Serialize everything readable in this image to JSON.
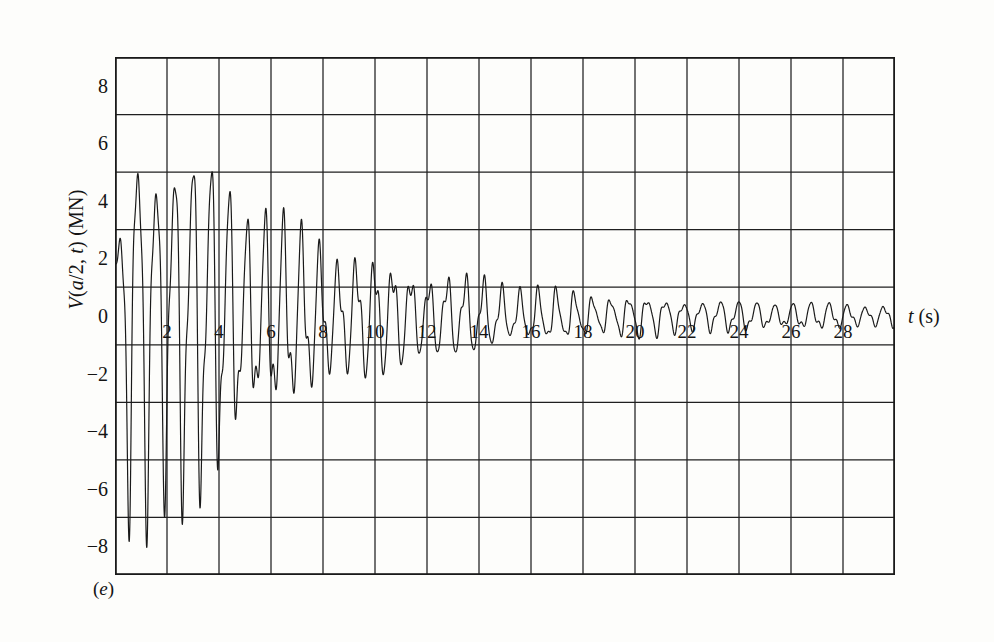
{
  "figure": {
    "caption_label": "(e)",
    "caption_open": "(",
    "caption_letter": "e",
    "caption_close": ")"
  },
  "axes": {
    "y_label_prefix": "V(",
    "y_label_var": "a",
    "y_label_mid": "/2, ",
    "y_label_var2": "t",
    "y_label_suffix": ") (MN)",
    "y_label_full": "V(a/2, t) (MN)",
    "x_label_var": "t",
    "x_label_suffix": " (s)",
    "x_label_full": "t (s)"
  },
  "chart_data": {
    "type": "line",
    "title": "",
    "subtitle": "",
    "xlabel": "t (s)",
    "ylabel": "V(a/2, t) (MN)",
    "xlim": [
      0,
      30
    ],
    "ylim": [
      -9,
      9
    ],
    "grid": true,
    "grid_x_step": 2,
    "grid_y_step": 2,
    "legend": "none",
    "x_tick_labels": [
      "2",
      "4",
      "6",
      "8",
      "10",
      "12",
      "14",
      "16",
      "18",
      "20",
      "22",
      "24",
      "26",
      "28"
    ],
    "x_tick_values": [
      2,
      4,
      6,
      8,
      10,
      12,
      14,
      16,
      18,
      20,
      22,
      24,
      26,
      28
    ],
    "y_tick_labels": [
      "8",
      "6",
      "4",
      "2",
      "0",
      "-2",
      "-4",
      "-6",
      "-8"
    ],
    "y_tick_values": [
      8,
      6,
      4,
      2,
      0,
      -2,
      -4,
      -6,
      -8
    ],
    "line_color": "#1a1a1a",
    "line_width": 1.2,
    "series": [
      {
        "name": "V(a/2, t)",
        "carrier_period_s": 0.7,
        "beat_period_s": 3.4,
        "initial_value": 2.0,
        "envelope_peak": 8.7,
        "envelope_peak_time_s": 1.0,
        "decay_time_constant_s": 7.2,
        "envelope_floor": 0.42,
        "envelope_samples": [
          {
            "t": 0.0,
            "amp": 2.6
          },
          {
            "t": 0.6,
            "amp": 8.0
          },
          {
            "t": 1.0,
            "amp": 8.7
          },
          {
            "t": 1.6,
            "amp": 8.6
          },
          {
            "t": 2.2,
            "amp": 7.9
          },
          {
            "t": 3.0,
            "amp": 7.1
          },
          {
            "t": 3.8,
            "amp": 6.4
          },
          {
            "t": 4.6,
            "amp": 5.4
          },
          {
            "t": 5.4,
            "amp": 4.6
          },
          {
            "t": 6.2,
            "amp": 4.0
          },
          {
            "t": 7.0,
            "amp": 3.5
          },
          {
            "t": 8.0,
            "amp": 3.0
          },
          {
            "t": 9.0,
            "amp": 2.6
          },
          {
            "t": 10.0,
            "amp": 2.3
          },
          {
            "t": 11.0,
            "amp": 2.0
          },
          {
            "t": 12.0,
            "amp": 1.8
          },
          {
            "t": 13.0,
            "amp": 1.6
          },
          {
            "t": 14.0,
            "amp": 1.5
          },
          {
            "t": 15.0,
            "amp": 1.3
          },
          {
            "t": 16.0,
            "amp": 1.1
          },
          {
            "t": 17.0,
            "amp": 1.0
          },
          {
            "t": 18.0,
            "amp": 0.9
          },
          {
            "t": 20.0,
            "amp": 0.8
          },
          {
            "t": 22.0,
            "amp": 0.7
          },
          {
            "t": 24.0,
            "amp": 0.6
          },
          {
            "t": 26.0,
            "amp": 0.55
          },
          {
            "t": 28.0,
            "amp": 0.5
          },
          {
            "t": 30.0,
            "amp": 0.45
          }
        ]
      }
    ]
  }
}
